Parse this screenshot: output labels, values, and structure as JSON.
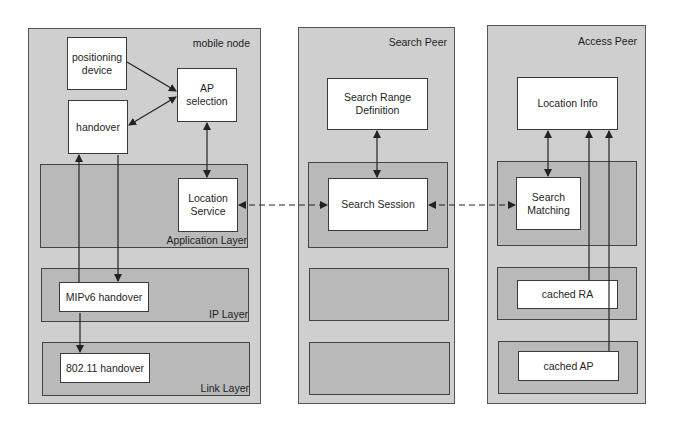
{
  "mobile_node": {
    "title": "mobile node",
    "boxes": {
      "positioning_device": "positioning\ndevice",
      "ap_selection": "AP\nselection",
      "handover": "handover",
      "location_service": "Location\nService",
      "mipv6_handover": "MIPv6 handover",
      "wifi_handover": "802.11 handover"
    },
    "layers": {
      "application": "Application Layer",
      "ip": "IP Layer",
      "link": "Link Layer"
    }
  },
  "search_peer": {
    "title": "Search Peer",
    "boxes": {
      "search_range_definition": "Search Range\nDefinition",
      "search_session": "Search Session"
    }
  },
  "access_peer": {
    "title": "Access Peer",
    "boxes": {
      "location_info": "Location Info",
      "search_matching": "Search\nMatching",
      "cached_ra": "cached RA",
      "cached_ap": "cached AP"
    }
  },
  "colors": {
    "node_fill": "#cfcfcf",
    "layer_fill": "#b9b9b9",
    "box_fill": "#ffffff",
    "stroke": "#333333"
  }
}
